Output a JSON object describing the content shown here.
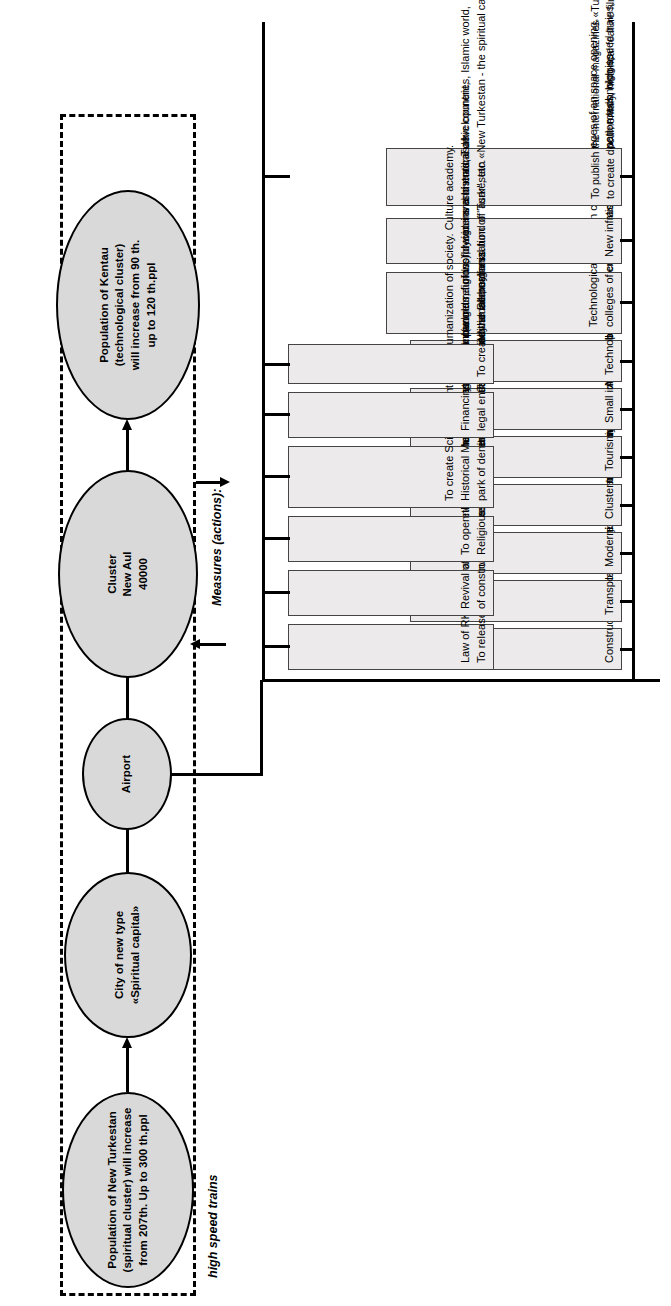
{
  "diagram": {
    "title_fragment": "",
    "labels": {
      "measures": "Measures  (actions):",
      "high_speed_trains": "high speed trains"
    },
    "nodes": [
      {
        "id": "population-kentau",
        "lines": [
          "Population of Kentau",
          "(technological cluster)",
          "will increase from 90 th.",
          "up to 120 th.ppl"
        ]
      },
      {
        "id": "cluster-new-aul",
        "lines": [
          "Cluster",
          "New Aul",
          "40000"
        ]
      },
      {
        "id": "airport",
        "lines": [
          "Airport"
        ]
      },
      {
        "id": "city-spiritual-capital",
        "lines": [
          "City of new type",
          "«Spiritual capital»"
        ]
      },
      {
        "id": "population-new-turkestan",
        "lines": [
          "Population of New Turkestan",
          "(spiritual cluster)  will increase",
          "from 207th. Up to 300 th.ppl"
        ]
      }
    ],
    "measures_top": [
      {
        "lines": [
          "Construction of plants of the 6th technological way"
        ]
      },
      {
        "lines": [
          "Transport and logistic center «Silk way»"
        ]
      },
      {
        "lines": [
          "Modernization of technological capacities"
        ]
      },
      {
        "lines": [
          "Cluster of the New Aul"
        ]
      },
      {
        "lines": [
          "Tourism cluster «A great Silk way»"
        ]
      },
      {
        "lines": [
          "Small innovative business center"
        ]
      },
      {
        "lines": [
          "Technopolises"
        ]
      },
      {
        "lines": [
          "Technological, agrarian colleges, colleges of an space opening,",
          "colleges of communication and information technologies"
        ]
      },
      {
        "lines": [
          "New infrastructure (airport, roads, high-speed trains, telecom, etc.)"
        ]
      }
    ],
    "measures_bottom": [
      {
        "lines": [
          "Law of RK about granting \"free economic zone\" status.",
          "To release the territory of Turkestan from taxes for 5 years, especially small business."
        ]
      },
      {
        "lines": [
          "Revival of history and culture of an antiquity at the expense",
          "of construction of the spiritual capital of New Turkestan"
        ]
      },
      {
        "lines": [
          "To open the International academy of religion (world religions), lyceums and madrasah.",
          "Religious studies center."
        ]
      },
      {
        "lines": [
          "To create Scientific center of a humanization of society.  Culture  academy.",
          "Historical Museum treasury, Park panorama of world-wide and historical development,",
          "park of denuclearized safety \"Baikonur Semey\""
        ]
      },
      {
        "lines": [
          "Financing sources:  budgets, funds, foreign investments, Turkic  countries, Islamic  world,",
          "legal entities  and individuals, organization of \"asar\", etc."
        ]
      },
      {
        "lines": [
          "To create the International fund of Turkestan «New Turkestan - the spiritual  capital»"
        ]
      }
    ],
    "measures_side": {
      "lines": [
        "To publish  the international magazines «Turan's open spaces», «New Turkestan – the spiritual  capital», «A spiritual  and technological cluster», «Image  of Kazakhstan»",
        "to create documentary, historical feature  films, TV series on a subject  «Turkestan - the spiritual  center».  Anthem of the Spiritual capital."
      ]
    },
    "colors": {
      "node_fill": "#d9d9d9",
      "box_fill": "#eceaea",
      "stroke": "#000000"
    }
  }
}
